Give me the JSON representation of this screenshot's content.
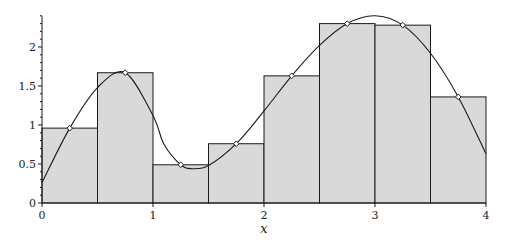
{
  "chart_data": {
    "type": "bar",
    "title": "",
    "xlabel": "x",
    "ylabel": "",
    "xlim": [
      0,
      4
    ],
    "ylim": [
      0,
      2.4
    ],
    "grid": false,
    "legend": null,
    "x_ticks": [
      "0",
      "1",
      "2",
      "3",
      "4"
    ],
    "y_ticks": [
      "0",
      "0.5",
      "1",
      "1.5",
      "2"
    ],
    "bars": {
      "bin_edges": [
        0,
        0.5,
        1,
        1.5,
        2,
        2.5,
        3,
        3.5,
        4
      ],
      "midpoints": [
        0.25,
        0.75,
        1.25,
        1.75,
        2.25,
        2.75,
        3.25,
        3.75
      ],
      "values": [
        0.96,
        1.67,
        0.49,
        0.76,
        1.63,
        2.3,
        2.28,
        1.36
      ],
      "fill": "#d9d9d9",
      "edge": "#1a1a1a"
    },
    "series": [
      {
        "name": "f(x)",
        "type": "line",
        "x": [
          0,
          0.25,
          0.5,
          0.75,
          1.0,
          1.1,
          1.25,
          1.35,
          1.5,
          1.75,
          2.0,
          2.25,
          2.5,
          2.75,
          3.0,
          3.25,
          3.5,
          3.75,
          4.0
        ],
        "y": [
          0.26,
          0.96,
          1.48,
          1.67,
          1.12,
          0.75,
          0.49,
          0.44,
          0.48,
          0.76,
          1.18,
          1.63,
          2.02,
          2.3,
          2.4,
          2.28,
          1.92,
          1.36,
          0.63
        ]
      },
      {
        "name": "midpoint samples",
        "type": "scatter",
        "marker": "diamond",
        "x": [
          0.25,
          0.75,
          1.25,
          1.75,
          2.25,
          2.75,
          3.25,
          3.75
        ],
        "y": [
          0.96,
          1.67,
          0.49,
          0.76,
          1.63,
          2.3,
          2.28,
          1.36
        ]
      }
    ],
    "annotation": "Midpoint Riemann sum approximation: 8 rectangles of width 0.5"
  },
  "layout": {
    "plot_left_px": 42,
    "plot_right_px": 486,
    "plot_bottom_px": 203,
    "px_per_x_unit": 111,
    "px_per_y_unit": 78
  }
}
